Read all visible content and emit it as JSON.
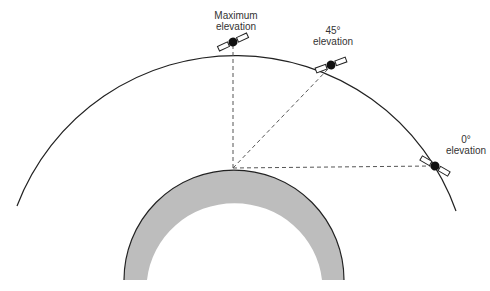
{
  "diagram": {
    "type": "satellite-elevation-geometry",
    "colors": {
      "orbit": "#222222",
      "earth_fill": "#bdbdbd",
      "earth_edge": "#222222",
      "dashed_line": "#555555",
      "satellite": "#111111",
      "panel_fill": "#ffffff"
    },
    "labels": {
      "max": "Maximum\nelevation",
      "max_line1": "Maximum",
      "max_line2": "elevation",
      "deg45_line1": "45°",
      "deg45_line2": "elevation",
      "deg0_line1": "0°",
      "deg0_line2": "elevation"
    },
    "satellites": [
      {
        "name": "maximum-elevation",
        "x": 233,
        "y": 42
      },
      {
        "name": "45-degree-elevation",
        "x": 331,
        "y": 65
      },
      {
        "name": "0-degree-elevation",
        "x": 435,
        "y": 166
      }
    ],
    "observer": {
      "x": 233,
      "y": 168
    }
  }
}
